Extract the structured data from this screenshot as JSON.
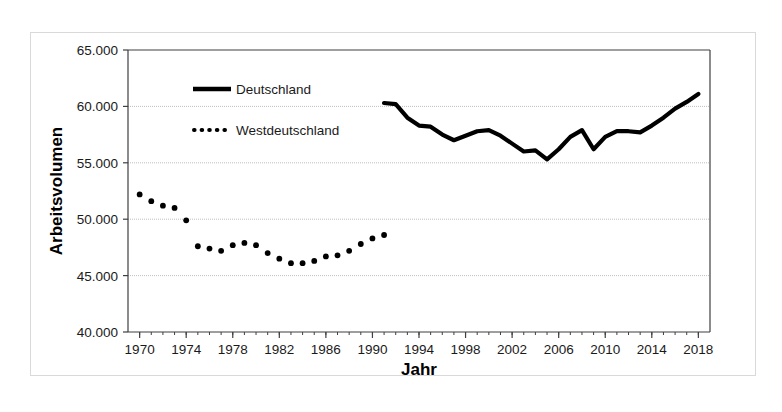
{
  "chart_data": {
    "type": "line",
    "title": "",
    "xlabel": "Jahr",
    "ylabel": "Arbeitsvolumen",
    "xlim": [
      1969,
      2019
    ],
    "ylim": [
      40000,
      65000
    ],
    "ytick_values": [
      40000,
      45000,
      50000,
      55000,
      60000,
      65000
    ],
    "ytick_labels": [
      "40.000",
      "45.000",
      "50.000",
      "55.000",
      "60.000",
      "65.000"
    ],
    "xtick_values": [
      1970,
      1974,
      1978,
      1982,
      1986,
      1990,
      1994,
      1998,
      2002,
      2006,
      2010,
      2014,
      2018
    ],
    "xtick_labels": [
      "1970",
      "1974",
      "1978",
      "1982",
      "1986",
      "1990",
      "1994",
      "1998",
      "2002",
      "2006",
      "2010",
      "2014",
      "2018"
    ],
    "grid": "horizontal-dotted",
    "legend_position": "upper-left-inside",
    "series": [
      {
        "name": "Deutschland",
        "style": "solid",
        "color": "#000000",
        "x": [
          1991,
          1992,
          1993,
          1994,
          1995,
          1996,
          1997,
          1998,
          1999,
          2000,
          2001,
          2002,
          2003,
          2004,
          2005,
          2006,
          2007,
          2008,
          2009,
          2010,
          2011,
          2012,
          2013,
          2014,
          2015,
          2016,
          2017,
          2018
        ],
        "values": [
          60300,
          60200,
          59000,
          58300,
          58200,
          57500,
          57000,
          57400,
          57800,
          57900,
          57400,
          56700,
          56000,
          56100,
          55300,
          56200,
          57300,
          57900,
          56200,
          57300,
          57800,
          57800,
          57700,
          58300,
          59000,
          59800,
          60400,
          61100
        ]
      },
      {
        "name": "Westdeutschland",
        "style": "dotted",
        "color": "#000000",
        "x": [
          1970,
          1971,
          1972,
          1973,
          1974,
          1975,
          1976,
          1977,
          1978,
          1979,
          1980,
          1981,
          1982,
          1983,
          1984,
          1985,
          1986,
          1987,
          1988,
          1989,
          1990,
          1991
        ],
        "values": [
          52200,
          51600,
          51200,
          51000,
          49900,
          47600,
          47400,
          47200,
          47700,
          47900,
          47700,
          47000,
          46500,
          46100,
          46100,
          46300,
          46700,
          46800,
          47200,
          47800,
          48300,
          48600
        ]
      }
    ]
  },
  "legend": {
    "items": [
      {
        "label": "Deutschland",
        "marker": "solid-line-swatch"
      },
      {
        "label": "Westdeutschland",
        "marker": "dotted-line-swatch"
      }
    ]
  },
  "axes": {
    "x_title": "Jahr",
    "y_title": "Arbeitsvolumen"
  }
}
